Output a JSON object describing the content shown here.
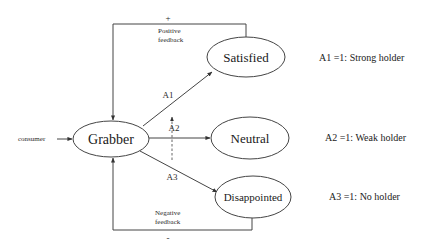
{
  "diagram": {
    "input": {
      "label": "consumer"
    },
    "nodes": {
      "grabber": {
        "label": "Grabber"
      },
      "satisfied": {
        "label": "Satisfied"
      },
      "neutral": {
        "label": "Neutral"
      },
      "disappointed": {
        "label": "Disappointed"
      }
    },
    "edges": {
      "a1": {
        "label": "A1"
      },
      "a2": {
        "label": "A2"
      },
      "a3": {
        "label": "A3"
      }
    },
    "feedback": {
      "positive": {
        "sign": "+",
        "line1": "Positive",
        "line2": "feedback"
      },
      "negative": {
        "sign": "-",
        "line1": "Negative",
        "line2": "feedback"
      }
    },
    "legend": [
      {
        "text": "A1 =1: Strong holder"
      },
      {
        "text": "A2 =1: Weak holder"
      },
      {
        "text": "A3 =1: No holder"
      }
    ],
    "colors": {
      "stroke": "#444444",
      "text": "#1a1a1a",
      "background": "#ffffff"
    }
  }
}
